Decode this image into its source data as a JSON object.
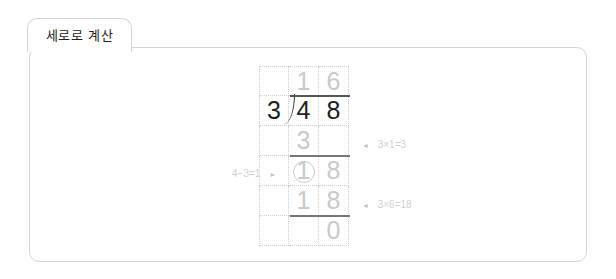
{
  "tab": {
    "label": "세로로 계산"
  },
  "division": {
    "divisor": "3",
    "dividend_digits": [
      "4",
      "8"
    ],
    "quotient_digits": [
      "1",
      "6"
    ],
    "step1_product": "3",
    "remainder_digit_circled": "1",
    "brought_down": "8",
    "step2_product_digits": [
      "1",
      "8"
    ],
    "final_remainder": "0"
  },
  "annotations": {
    "step1": {
      "arrow": "◄",
      "text": "3×1=3"
    },
    "subtract": {
      "text": "4−3=1",
      "arrow": "►"
    },
    "step2": {
      "arrow": "◄",
      "text": "3×6=18"
    }
  },
  "colors": {
    "dark_digit": "#1e1e1e",
    "light_digit": "#c9c9c9",
    "border": "#d4d4d4",
    "rule": "#555555"
  }
}
